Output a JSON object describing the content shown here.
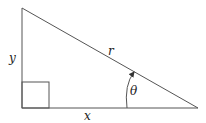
{
  "diagram": {
    "title": "",
    "type": "right-triangle",
    "labels": {
      "vertical_leg": "y",
      "horizontal_leg": "x",
      "hypotenuse": "r",
      "angle": "θ"
    },
    "colors": {
      "stroke": "#555555",
      "background": "#ffffff",
      "text": "#222222"
    }
  }
}
